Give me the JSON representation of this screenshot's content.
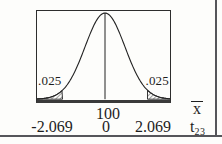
{
  "figure": {
    "tail_labels": {
      "left": ".025",
      "right": ".025"
    },
    "xbar_axis": {
      "mean": "100",
      "symbol": "x"
    },
    "t_axis": {
      "left_critical": "-2.069",
      "zero": "0",
      "right_critical": "2.069",
      "symbol": "t",
      "subscript": "23"
    }
  },
  "chart_data": {
    "type": "area",
    "title": "",
    "distribution": "t",
    "degrees_of_freedom": 23,
    "curve": "symmetric bell-shaped density with vertical line at center",
    "center": {
      "xbar": 100,
      "t": 0
    },
    "critical_values_t": [
      -2.069,
      2.069
    ],
    "tail_areas": [
      0.025,
      0.025
    ],
    "shaded_regions": [
      {
        "region": "left tail, t <= -2.069",
        "area": 0.025,
        "style": "diagonal hatch"
      },
      {
        "region": "right tail, t >= 2.069",
        "area": 0.025,
        "style": "diagonal hatch"
      }
    ],
    "axes": [
      {
        "name": "x̄",
        "labels_shown": [
          "100"
        ]
      },
      {
        "name": "t23",
        "labels_shown": [
          "-2.069",
          "0",
          "2.069"
        ]
      }
    ],
    "center_line": true,
    "frame": "rectangular box around plot",
    "legend": "none",
    "grid": "off"
  },
  "colors": {
    "ink": "#1e1e1e",
    "box_border": "#2d2d2d",
    "page_rule": "#55555a",
    "background": "#fdfdfb"
  }
}
